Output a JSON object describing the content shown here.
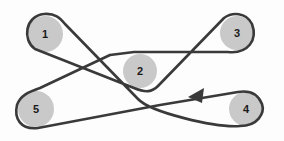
{
  "diagram": {
    "type": "serpentine-belt-routing",
    "pulleys": [
      {
        "id": "1",
        "label": "1",
        "cx": 45,
        "cy": 34,
        "r": 18
      },
      {
        "id": "2",
        "label": "2",
        "cx": 140,
        "cy": 71,
        "r": 17
      },
      {
        "id": "3",
        "label": "3",
        "cx": 237,
        "cy": 33,
        "r": 17
      },
      {
        "id": "4",
        "label": "4",
        "cx": 246,
        "cy": 109,
        "r": 17
      },
      {
        "id": "5",
        "label": "5",
        "cx": 36,
        "cy": 109,
        "r": 18
      }
    ],
    "belt_direction": "arrow between pulley 4 and pulley 5 pointing left (toward 5)",
    "colors": {
      "pulley_fill": "#c9c9c9",
      "belt_stroke": "#3a3a3a",
      "label": "#1a1a1a"
    }
  }
}
